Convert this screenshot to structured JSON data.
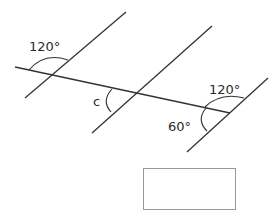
{
  "diagram": {
    "type": "parallel-lines-with-transversal",
    "line_color": "#333333",
    "labels": {
      "angle_top_left": "120°",
      "angle_unknown": "c",
      "angle_right_top": "120°",
      "angle_right_bottom": "60°"
    },
    "answer_box": {
      "value": ""
    }
  }
}
